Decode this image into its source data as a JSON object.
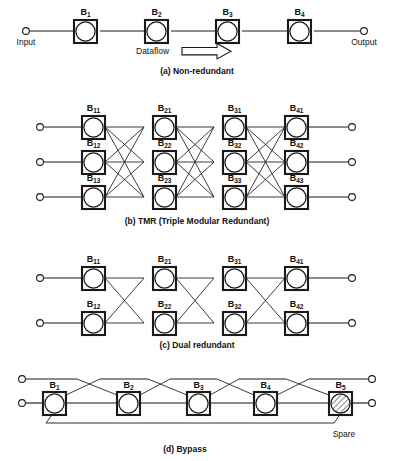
{
  "figure": {
    "line_color": "#1a1a1a",
    "background_color": "#ffffff"
  },
  "panels": [
    {
      "id": "non-redundant",
      "caption": "(a) Non-redundant",
      "input_label": "Input",
      "output_label": "Output",
      "flow_label": "Dataflow",
      "rows": 1,
      "stages": 4,
      "blocks": [
        {
          "base": "B",
          "sub": "1"
        },
        {
          "base": "B",
          "sub": "2"
        },
        {
          "base": "B",
          "sub": "3"
        },
        {
          "base": "B",
          "sub": "4"
        }
      ]
    },
    {
      "id": "tmr",
      "caption": "(b) TMR (Triple Modular Redundant)",
      "rows": 3,
      "stages": 4,
      "interconnect": "full-crossbar",
      "blocks": [
        {
          "base": "B",
          "sub": "11"
        },
        {
          "base": "B",
          "sub": "21"
        },
        {
          "base": "B",
          "sub": "31"
        },
        {
          "base": "B",
          "sub": "41"
        },
        {
          "base": "B",
          "sub": "12"
        },
        {
          "base": "B",
          "sub": "22"
        },
        {
          "base": "B",
          "sub": "32"
        },
        {
          "base": "B",
          "sub": "42"
        },
        {
          "base": "B",
          "sub": "13"
        },
        {
          "base": "B",
          "sub": "23"
        },
        {
          "base": "B",
          "sub": "33"
        },
        {
          "base": "B",
          "sub": "43"
        }
      ]
    },
    {
      "id": "dual-redundant",
      "caption": "(c) Dual redundant",
      "rows": 2,
      "stages": 4,
      "interconnect": "cross",
      "blocks": [
        {
          "base": "B",
          "sub": "11"
        },
        {
          "base": "B",
          "sub": "21"
        },
        {
          "base": "B",
          "sub": "31"
        },
        {
          "base": "B",
          "sub": "41"
        },
        {
          "base": "B",
          "sub": "12"
        },
        {
          "base": "B",
          "sub": "22"
        },
        {
          "base": "B",
          "sub": "32"
        },
        {
          "base": "B",
          "sub": "42"
        }
      ]
    },
    {
      "id": "bypass",
      "caption": "(d) Bypass",
      "rows": 1,
      "stages": 5,
      "spare_label": "Spare",
      "blocks": [
        {
          "base": "B",
          "sub": "1"
        },
        {
          "base": "B",
          "sub": "2"
        },
        {
          "base": "B",
          "sub": "3"
        },
        {
          "base": "B",
          "sub": "4"
        },
        {
          "base": "B",
          "sub": "5"
        }
      ]
    }
  ]
}
